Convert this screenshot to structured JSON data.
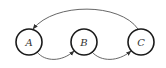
{
  "diagram": {
    "type": "state-graph",
    "nodes": [
      {
        "id": "A",
        "label": "A"
      },
      {
        "id": "B",
        "label": "B"
      },
      {
        "id": "C",
        "label": "C"
      }
    ],
    "edges": [
      {
        "from": "A",
        "to": "B",
        "style": "curved-below"
      },
      {
        "from": "B",
        "to": "C",
        "style": "curved-below"
      },
      {
        "from": "C",
        "to": "A",
        "style": "arc-above"
      }
    ],
    "colors": {
      "node_stroke": "#1a1a1a",
      "edge_stroke": "#555555",
      "label": "#333333",
      "background": "#ffffff"
    }
  }
}
